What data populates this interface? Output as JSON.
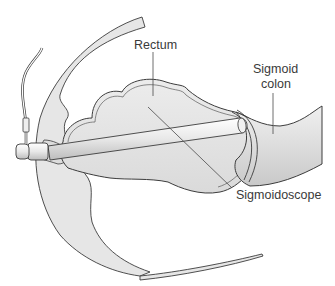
{
  "figure": {
    "labels": {
      "rectum": "Rectum",
      "sigmoid_colon_line1": "Sigmoid",
      "sigmoid_colon_line2": "colon",
      "sigmoidoscope": "Sigmoidoscope"
    },
    "colors": {
      "tissue_fill": "#e4e4e4",
      "lumen_fill": "#ececec",
      "outline": "#3c3c3c",
      "scope_fill": "#f2f2f2",
      "leader_line": "#4a4a4a"
    }
  }
}
